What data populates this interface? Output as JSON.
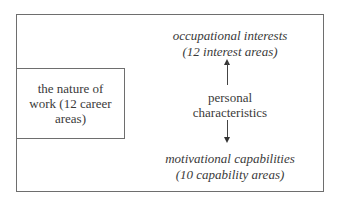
{
  "diagram": {
    "left_box": {
      "line1": "the nature of",
      "line2": "work (12 career",
      "line3": "areas)"
    },
    "top_node": {
      "line1": "occupational interests",
      "line2": "(12 interest areas)"
    },
    "center_node": {
      "line1": "personal",
      "line2": "characteristics"
    },
    "bottom_node": {
      "line1": "motivational capabilities",
      "line2": "(10 capability areas)"
    },
    "arrows": [
      {
        "from": "personal characteristics",
        "to": "occupational interests",
        "direction": "up"
      },
      {
        "from": "personal characteristics",
        "to": "motivational capabilities",
        "direction": "down"
      }
    ],
    "colors": {
      "border": "#6e6e6e",
      "text": "#3a3a3a",
      "arrow": "#333333"
    }
  }
}
